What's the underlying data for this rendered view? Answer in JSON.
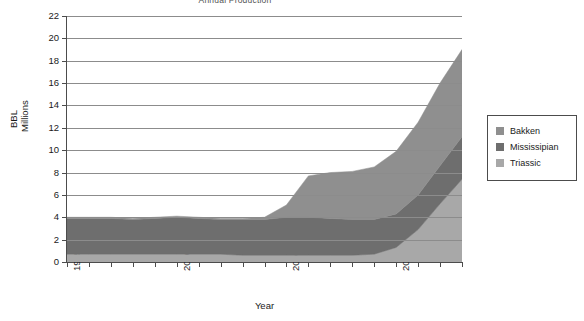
{
  "chart_data": {
    "type": "area",
    "stacked": true,
    "title": "Annual Production",
    "xlabel": "Year",
    "ylabel": "BBL Millions",
    "ylabel_lines": [
      "BBL",
      "Millions"
    ],
    "grid": true,
    "legend_position": "right",
    "xlim": [
      1995,
      2013
    ],
    "ylim": [
      0,
      22
    ],
    "ytick_step": 2,
    "yticks": [
      0,
      2,
      4,
      6,
      8,
      10,
      12,
      14,
      16,
      18,
      20,
      22
    ],
    "xticks_labeled": [
      "1995",
      "2000",
      "2005",
      "2010"
    ],
    "xticks_labeled_values": [
      1995,
      2000,
      2005,
      2010
    ],
    "x": [
      1995,
      1996,
      1997,
      1998,
      1999,
      2000,
      2001,
      2002,
      2003,
      2004,
      2005,
      2006,
      2007,
      2008,
      2009,
      2010,
      2011,
      2012,
      2013
    ],
    "series": [
      {
        "name": "Triassic",
        "color": "#a8a8a8",
        "values": [
          0.7,
          0.7,
          0.7,
          0.7,
          0.7,
          0.7,
          0.7,
          0.7,
          0.6,
          0.6,
          0.6,
          0.6,
          0.6,
          0.6,
          0.7,
          1.3,
          2.9,
          5.2,
          7.4
        ]
      },
      {
        "name": "Mississipian",
        "color": "#6e6e6e",
        "values": [
          3.2,
          3.2,
          3.2,
          3.1,
          3.2,
          3.3,
          3.2,
          3.1,
          3.2,
          3.2,
          3.4,
          3.4,
          3.3,
          3.2,
          3.1,
          3.0,
          3.1,
          3.4,
          3.8
        ]
      },
      {
        "name": "Bakken",
        "color": "#8f8f8f",
        "values": [
          0.1,
          0.1,
          0.1,
          0.1,
          0.1,
          0.1,
          0.1,
          0.1,
          0.1,
          0.2,
          1.1,
          3.7,
          4.1,
          4.3,
          4.7,
          5.6,
          6.5,
          7.4,
          7.8
        ]
      }
    ],
    "totals": [
      4.0,
      4.0,
      4.0,
      3.9,
      4.0,
      4.1,
      4.0,
      3.9,
      3.9,
      4.0,
      5.1,
      7.7,
      8.0,
      8.1,
      8.5,
      9.9,
      12.5,
      16.0,
      19.0
    ]
  },
  "legend": {
    "items": [
      {
        "label": "Bakken",
        "color": "#8f8f8f"
      },
      {
        "label": "Mississipian",
        "color": "#6e6e6e"
      },
      {
        "label": "Triassic",
        "color": "#a8a8a8"
      }
    ]
  }
}
